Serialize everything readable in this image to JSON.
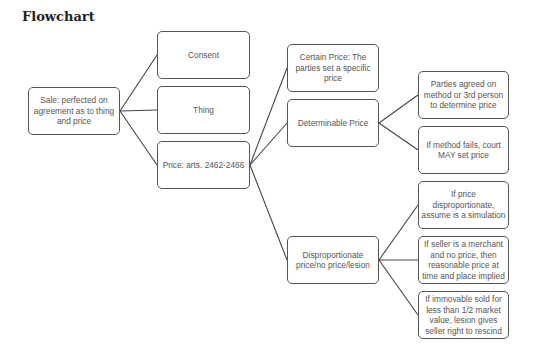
{
  "title": "Flowchart",
  "nodes": {
    "sale": "Sale: perfected on agreement as to thing and price",
    "consent": "Consent",
    "thing": "Thing",
    "price": "Price: arts. 2462-2466",
    "certain": "Certain Price: The parties set a specific price",
    "determinable": "Determinable Price",
    "disproportionate": "Disproportionate price/no price/lesion",
    "method_agreed": "Parties agreed on method or 3rd person to determine price",
    "method_fails": "If method fails, court MAY set price",
    "simulation": "If price disproportionate, assume is a simulation",
    "merchant": "If seller is a merchant and no price, then reasonable price at time and place implied",
    "lesion": "If immovable sold for less than 1/2 market value, lesion gives seller right to rescind"
  },
  "colors": {
    "border": "#555555",
    "text": "#555555",
    "line": "#444444"
  }
}
